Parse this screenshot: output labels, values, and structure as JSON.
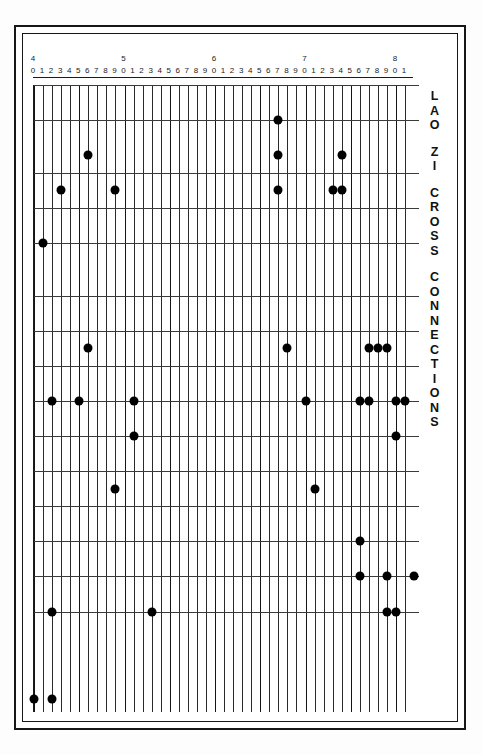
{
  "figure": {
    "title_vertical": "LAO ZI CROSS CONNECTIONS",
    "title_words": [
      "LAO",
      "ZI",
      "CROSS",
      "CONNECTIONS"
    ],
    "background_color": "#ffffff",
    "ink_color": "#000000"
  },
  "axis": {
    "decade_labels": [
      "4",
      "5",
      "6",
      "7",
      "8"
    ],
    "unit_labels": [
      "0",
      "1",
      "2",
      "3",
      "4",
      "5",
      "6",
      "7",
      "8",
      "9",
      "0",
      "1",
      "2",
      "3",
      "4",
      "5",
      "6",
      "7",
      "8",
      "9",
      "0",
      "1",
      "2",
      "3",
      "4",
      "5",
      "6",
      "7",
      "8",
      "9",
      "0",
      "1",
      "2",
      "3",
      "4",
      "5",
      "6",
      "7",
      "8",
      "9",
      "0",
      "1"
    ],
    "min": 40,
    "max": 81,
    "major_every": 5
  },
  "chart_data": {
    "type": "scatter",
    "xlabel": "",
    "ylabel": "",
    "xlim": [
      40,
      81
    ],
    "ylim": [
      1,
      32
    ],
    "grid": true,
    "legend": "none",
    "x_tick_labels": [
      "40",
      "41",
      "42",
      "43",
      "44",
      "45",
      "46",
      "47",
      "48",
      "49",
      "50",
      "51",
      "52",
      "53",
      "54",
      "55",
      "56",
      "57",
      "58",
      "59",
      "60",
      "61",
      "62",
      "63",
      "64",
      "65",
      "66",
      "67",
      "68",
      "69",
      "70",
      "71",
      "72",
      "73",
      "74",
      "75",
      "76",
      "77",
      "78",
      "79",
      "80",
      "81"
    ],
    "x_major_ticks": [
      40,
      50,
      60,
      70,
      80
    ],
    "y_major_rows": [
      2,
      5,
      7,
      9,
      12,
      14,
      16,
      18,
      20,
      22,
      24,
      26,
      28,
      30
    ],
    "points": [
      {
        "x": 67,
        "row": 2
      },
      {
        "x": 46,
        "row": 4
      },
      {
        "x": 67,
        "row": 4
      },
      {
        "x": 74,
        "row": 4
      },
      {
        "x": 43,
        "row": 6
      },
      {
        "x": 49,
        "row": 6
      },
      {
        "x": 67,
        "row": 6
      },
      {
        "x": 73,
        "row": 6
      },
      {
        "x": 74,
        "row": 6
      },
      {
        "x": 41,
        "row": 9
      },
      {
        "x": 46,
        "row": 15
      },
      {
        "x": 68,
        "row": 15
      },
      {
        "x": 77,
        "row": 15
      },
      {
        "x": 78,
        "row": 15
      },
      {
        "x": 79,
        "row": 15
      },
      {
        "x": 42,
        "row": 18
      },
      {
        "x": 45,
        "row": 18
      },
      {
        "x": 51,
        "row": 18
      },
      {
        "x": 70,
        "row": 18
      },
      {
        "x": 76,
        "row": 18
      },
      {
        "x": 77,
        "row": 18
      },
      {
        "x": 80,
        "row": 18
      },
      {
        "x": 81,
        "row": 18
      },
      {
        "x": 51,
        "row": 20
      },
      {
        "x": 80,
        "row": 20
      },
      {
        "x": 49,
        "row": 23
      },
      {
        "x": 71,
        "row": 23
      },
      {
        "x": 76,
        "row": 26
      },
      {
        "x": 76,
        "row": 28
      },
      {
        "x": 79,
        "row": 28
      },
      {
        "x": 82,
        "row": 28
      },
      {
        "x": 42,
        "row": 30
      },
      {
        "x": 53,
        "row": 30
      },
      {
        "x": 79,
        "row": 30
      },
      {
        "x": 80,
        "row": 30
      },
      {
        "x": 40,
        "row": 35
      },
      {
        "x": 42,
        "row": 35
      }
    ]
  }
}
